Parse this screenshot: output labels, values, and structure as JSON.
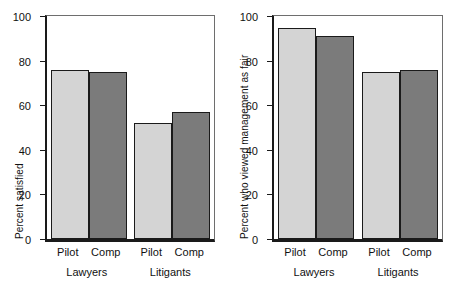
{
  "figure": {
    "background_color": "#ffffff",
    "light_bar_color": "#d4d4d4",
    "dark_bar_color": "#7b7b7b",
    "axis_color": "#1a1a1a"
  },
  "chart_data": [
    {
      "type": "bar",
      "title": "",
      "xlabel": "",
      "ylabel": "Percent satisfied",
      "ylim": [
        0,
        100
      ],
      "yticks": [
        0,
        20,
        40,
        60,
        80,
        100
      ],
      "grid": false,
      "legend": "none",
      "categories": [
        "Lawyers",
        "Litigants"
      ],
      "subcategories": [
        "Pilot",
        "Comp"
      ],
      "series": [
        {
          "name": "Pilot",
          "values": [
            76,
            52
          ],
          "color": "#d4d4d4"
        },
        {
          "name": "Comp",
          "values": [
            75,
            57
          ],
          "color": "#7b7b7b"
        }
      ]
    },
    {
      "type": "bar",
      "title": "",
      "xlabel": "",
      "ylabel": "Percent who viewed management as fair",
      "ylim": [
        0,
        100
      ],
      "yticks": [
        0,
        20,
        40,
        60,
        80,
        100
      ],
      "grid": false,
      "legend": "none",
      "categories": [
        "Lawyers",
        "Litigants"
      ],
      "subcategories": [
        "Pilot",
        "Comp"
      ],
      "series": [
        {
          "name": "Pilot",
          "values": [
            94.5,
            75
          ],
          "color": "#d4d4d4"
        },
        {
          "name": "Comp",
          "values": [
            91,
            76
          ],
          "color": "#7b7b7b"
        }
      ]
    }
  ]
}
